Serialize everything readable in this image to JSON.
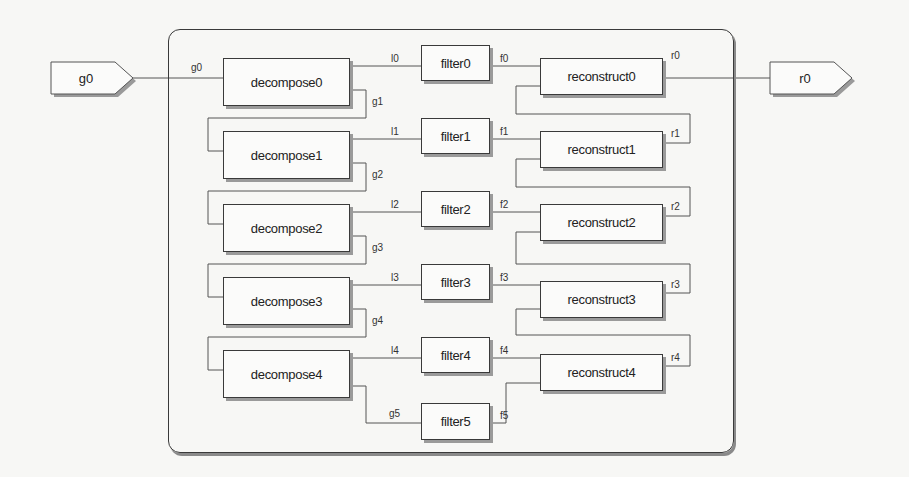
{
  "diagram": {
    "input_port": {
      "label": "g0"
    },
    "output_port": {
      "label": "r0"
    },
    "decompose": [
      "decompose0",
      "decompose1",
      "decompose2",
      "decompose3",
      "decompose4"
    ],
    "filters": [
      "filter0",
      "filter1",
      "filter2",
      "filter3",
      "filter4",
      "filter5"
    ],
    "reconstruct": [
      "reconstruct0",
      "reconstruct1",
      "reconstruct2",
      "reconstruct3",
      "reconstruct4"
    ],
    "signal_labels": {
      "g": [
        "g0",
        "g1",
        "g2",
        "g3",
        "g4",
        "g5"
      ],
      "l": [
        "l0",
        "l1",
        "l2",
        "l3",
        "l4"
      ],
      "f": [
        "f0",
        "f1",
        "f2",
        "f3",
        "f4",
        "f5"
      ],
      "r": [
        "r0",
        "r1",
        "r2",
        "r3",
        "r4"
      ]
    },
    "colors": {
      "line": "#555555",
      "border": "#3a3a3a",
      "shadow": "#9a9a9a",
      "background": "#f7f7f5"
    }
  }
}
